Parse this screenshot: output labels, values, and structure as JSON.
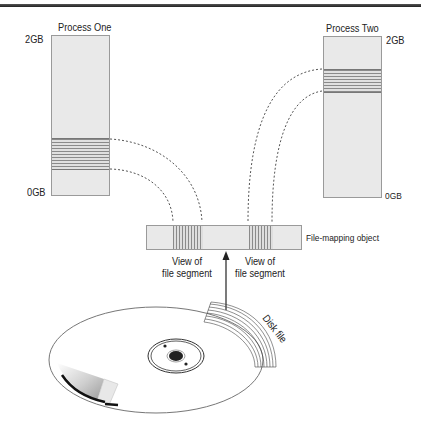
{
  "diagram": {
    "process_one": {
      "title": "Process One",
      "top_label": "2GB",
      "bottom_label": "0GB"
    },
    "process_two": {
      "title": "Process Two",
      "top_label": "2GB",
      "bottom_label": "0GB"
    },
    "file_mapping_object": {
      "label": "File-mapping object",
      "views": [
        {
          "line1": "View of",
          "line2": "file segment"
        },
        {
          "line1": "View of",
          "line2": "file segment"
        }
      ]
    },
    "disk": {
      "label": "Disk file"
    },
    "colors": {
      "box_fill": "#e9e9e9",
      "box_border": "#9a9a9a",
      "stripe": "#8a8a8a",
      "connector": "#555555"
    }
  }
}
